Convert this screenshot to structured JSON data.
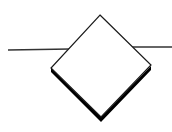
{
  "diagram": {
    "type": "flowchart-decision",
    "shape": "diamond",
    "label": "",
    "colors": {
      "background": "#ffffff",
      "fill": "#ffffff",
      "stroke": "#1a1a1a",
      "shadow": "#000000"
    },
    "connectors": [
      {
        "side": "left",
        "direction": "incoming"
      },
      {
        "side": "right",
        "direction": "outgoing"
      }
    ]
  }
}
